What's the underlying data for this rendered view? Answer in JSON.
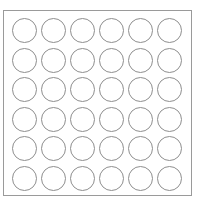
{
  "diagram": {
    "type": "circle-grid",
    "rows": 6,
    "columns": 6,
    "cell_shape": "circle",
    "cell_fill": "#ffffff",
    "cell_stroke": "#8e8e8e",
    "frame_stroke": "#9a9a9a",
    "cells": [
      [
        "",
        "",
        "",
        "",
        "",
        ""
      ],
      [
        "",
        "",
        "",
        "",
        "",
        ""
      ],
      [
        "",
        "",
        "",
        "",
        "",
        ""
      ],
      [
        "",
        "",
        "",
        "",
        "",
        ""
      ],
      [
        "",
        "",
        "",
        "",
        "",
        ""
      ],
      [
        "",
        "",
        "",
        "",
        "",
        ""
      ]
    ]
  }
}
